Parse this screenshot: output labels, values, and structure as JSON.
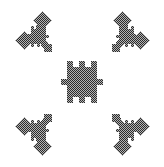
{
  "image": {
    "title": "Checkerboard-dithered fractal snowflake",
    "width": 164,
    "height": 167,
    "background_color": "#ffffff",
    "alt_text": "Monochrome pixel-art fractal: a central square blob with four nubs, surrounded by four smaller mirrored copies at the corners, all filled with a checkerboard dither."
  },
  "palette": {
    "background": "#ffffff",
    "dither_dark": "#2b2b2b",
    "dither_light": "#b4b4b4",
    "edge_soft": "#8e8e8e"
  },
  "render": {
    "dither_cell_px": 1,
    "dither_type": "checkerboard",
    "anti_aliased": false
  },
  "chart_data": {
    "type": "scatter",
    "xlabel": "",
    "ylabel": "",
    "grid": false,
    "legend": null,
    "xlim": [
      0,
      164
    ],
    "ylim": [
      0,
      167
    ],
    "motifs": [
      {
        "name": "center-blob",
        "role": "center",
        "cx": 82,
        "cy": 82,
        "core_w": 30,
        "core_h": 30,
        "nubs": 4,
        "nub_size": 6,
        "scale": 1.0,
        "mirror_x": false,
        "mirror_y": false
      },
      {
        "name": "cluster-top-left",
        "role": "corner",
        "cx": 38,
        "cy": 36,
        "core_w": 15,
        "core_h": 15,
        "nubs": 4,
        "nub_size": 3,
        "scale": 0.5,
        "mirror_x": false,
        "mirror_y": false,
        "children": [
          {
            "name": "diamond-up",
            "cx": 42,
            "cy": 20,
            "size": 18,
            "shape": "diamond"
          },
          {
            "name": "diamond-left",
            "cx": 24,
            "cy": 40,
            "size": 18,
            "shape": "diamond"
          },
          {
            "name": "square-small",
            "cx": 48,
            "cy": 48,
            "size": 8,
            "shape": "square"
          }
        ]
      },
      {
        "name": "cluster-top-right",
        "role": "corner",
        "cx": 126,
        "cy": 36,
        "core_w": 15,
        "core_h": 15,
        "nubs": 4,
        "nub_size": 3,
        "scale": 0.5,
        "mirror_x": true,
        "mirror_y": false,
        "children": [
          {
            "name": "diamond-up",
            "cx": 122,
            "cy": 20,
            "size": 18,
            "shape": "diamond"
          },
          {
            "name": "diamond-right",
            "cx": 140,
            "cy": 40,
            "size": 18,
            "shape": "diamond"
          },
          {
            "name": "square-small",
            "cx": 116,
            "cy": 48,
            "size": 8,
            "shape": "square"
          }
        ]
      },
      {
        "name": "cluster-bottom-left",
        "role": "corner",
        "cx": 38,
        "cy": 130,
        "core_w": 15,
        "core_h": 15,
        "nubs": 4,
        "nub_size": 3,
        "scale": 0.5,
        "mirror_x": false,
        "mirror_y": true,
        "children": [
          {
            "name": "diamond-down",
            "cx": 42,
            "cy": 146,
            "size": 18,
            "shape": "diamond"
          },
          {
            "name": "diamond-left",
            "cx": 24,
            "cy": 126,
            "size": 18,
            "shape": "diamond"
          },
          {
            "name": "square-small",
            "cx": 48,
            "cy": 118,
            "size": 8,
            "shape": "square"
          }
        ]
      },
      {
        "name": "cluster-bottom-right",
        "role": "corner",
        "cx": 126,
        "cy": 130,
        "core_w": 15,
        "core_h": 15,
        "nubs": 4,
        "nub_size": 3,
        "scale": 0.5,
        "mirror_x": true,
        "mirror_y": true,
        "children": [
          {
            "name": "diamond-down",
            "cx": 122,
            "cy": 146,
            "size": 18,
            "shape": "diamond"
          },
          {
            "name": "diamond-right",
            "cx": 140,
            "cy": 126,
            "size": 18,
            "shape": "diamond"
          },
          {
            "name": "square-small",
            "cx": 116,
            "cy": 118,
            "size": 8,
            "shape": "square"
          }
        ]
      }
    ]
  }
}
